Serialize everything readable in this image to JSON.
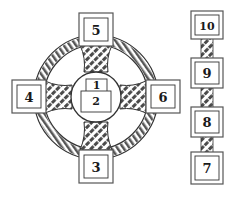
{
  "colors": {
    "ink": "#1a1a1a",
    "frame": "#555555",
    "knot_fill": "#6e6e6e",
    "background": "#ffffff"
  },
  "cross": {
    "positions": [
      {
        "id": 1,
        "label": "1",
        "placement": "center-top"
      },
      {
        "id": 2,
        "label": "2",
        "placement": "center-crossing"
      },
      {
        "id": 3,
        "label": "3",
        "placement": "bottom"
      },
      {
        "id": 4,
        "label": "4",
        "placement": "left"
      },
      {
        "id": 5,
        "label": "5",
        "placement": "top"
      },
      {
        "id": 6,
        "label": "6",
        "placement": "right"
      }
    ]
  },
  "staff": {
    "positions": [
      {
        "id": 10,
        "label": "10",
        "placement": "staff-top"
      },
      {
        "id": 9,
        "label": "9",
        "placement": "staff-upper"
      },
      {
        "id": 8,
        "label": "8",
        "placement": "staff-lower"
      },
      {
        "id": 7,
        "label": "7",
        "placement": "staff-bottom"
      }
    ]
  }
}
